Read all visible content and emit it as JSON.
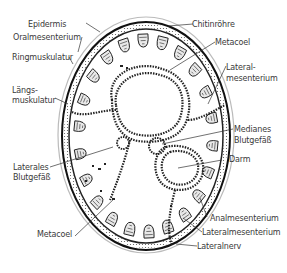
{
  "diagram": {
    "colors": {
      "ink": "#1a1a1a",
      "label": "#3a3a3a",
      "background": "#ffffff"
    },
    "labels_left": [
      {
        "id": "epidermis",
        "text": "Epidermis"
      },
      {
        "id": "oralmesenterium",
        "text": "Oralmesenterium"
      },
      {
        "id": "ringmuskulatur",
        "text": "Ringmuskulatur"
      },
      {
        "id": "laengsmuskulatur",
        "line1": "Längs-",
        "line2": "muskulatur"
      },
      {
        "id": "laterales-blutgefaess",
        "line1": "Laterales",
        "line2": "Blutgefäß"
      },
      {
        "id": "metacoel-bottom",
        "text": "Metacoel"
      }
    ],
    "labels_right": [
      {
        "id": "chitinroehre",
        "text": "Chitinröhre"
      },
      {
        "id": "metacoel-top",
        "text": "Metacoel"
      },
      {
        "id": "lateralmesenterium-top",
        "line1": "Lateral-",
        "line2": "mesenterium"
      },
      {
        "id": "medianes-blutgefaess",
        "line1": "Medianes",
        "line2": "Blutgefäß"
      },
      {
        "id": "darm",
        "text": "Darm"
      },
      {
        "id": "analmesenterium",
        "text": "Analmesenterium"
      },
      {
        "id": "lateralmesenterium-bottom",
        "text": "Lateralmesenterium"
      },
      {
        "id": "lateralnerv",
        "text": "Lateralnerv"
      }
    ]
  }
}
